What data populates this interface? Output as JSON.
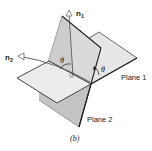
{
  "figure": {
    "caption": "(b)",
    "labels": {
      "normal1": "n",
      "normal1_sub": "1",
      "normal2": "n",
      "normal2_sub": "2",
      "theta_normals": "θ",
      "theta_planes": "θ",
      "plane1": "Plane 1",
      "plane2": "Plane 2"
    },
    "colors": {
      "plane1_fill": "#e6e6e6",
      "plane2_fill": "#c8c8c8",
      "plane2_light": "#d6d6d6",
      "edge": "#2a2a2a",
      "normal_line": "#555555"
    }
  }
}
